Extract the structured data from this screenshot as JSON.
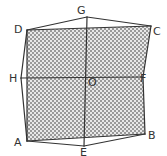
{
  "diagram": {
    "type": "geometry-figure",
    "colors": {
      "stroke": "#333333",
      "shade_dark": "#9a9a9a",
      "shade_light": "#e8e8e8",
      "background": "#ffffff"
    },
    "points": {
      "A": {
        "label": "A",
        "x": 27,
        "y": 141,
        "lx": 14,
        "ly": 146
      },
      "B": {
        "label": "B",
        "x": 145,
        "y": 134,
        "lx": 148,
        "ly": 139
      },
      "C": {
        "label": "C",
        "x": 151,
        "y": 26,
        "lx": 153,
        "ly": 35
      },
      "D": {
        "label": "D",
        "x": 27,
        "y": 30,
        "lx": 14,
        "ly": 33
      },
      "E": {
        "label": "E",
        "x": 84,
        "y": 146,
        "lx": 80,
        "ly": 156
      },
      "F": {
        "label": "F",
        "x": 143,
        "y": 77,
        "lx": 140,
        "ly": 82
      },
      "G": {
        "label": "G",
        "x": 87,
        "y": 17,
        "lx": 77,
        "ly": 14
      },
      "H": {
        "label": "H",
        "x": 21,
        "y": 78,
        "lx": 9,
        "ly": 82
      },
      "O": {
        "label": "O",
        "x": 86,
        "y": 77,
        "lx": 88,
        "ly": 86
      }
    },
    "shaded_region": [
      "D",
      "C",
      "F",
      "B",
      "A"
    ],
    "segments": [
      [
        "D",
        "G"
      ],
      [
        "G",
        "C"
      ],
      [
        "C",
        "F"
      ],
      [
        "F",
        "B"
      ],
      [
        "B",
        "E"
      ],
      [
        "E",
        "A"
      ],
      [
        "A",
        "H"
      ],
      [
        "H",
        "D"
      ],
      [
        "D",
        "C"
      ],
      [
        "A",
        "B"
      ],
      [
        "D",
        "A"
      ],
      [
        "H",
        "F"
      ],
      [
        "G",
        "E"
      ]
    ]
  }
}
